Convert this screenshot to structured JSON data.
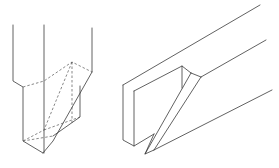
{
  "figure": {
    "left_figure": "vertical post with angled (scarf) cut shown with hidden dashed lines",
    "right_figure": "horizontal beam end with diagonal slot/bridle notch",
    "stroke_color": "#3a3a3a",
    "background_color": "#ffffff"
  }
}
